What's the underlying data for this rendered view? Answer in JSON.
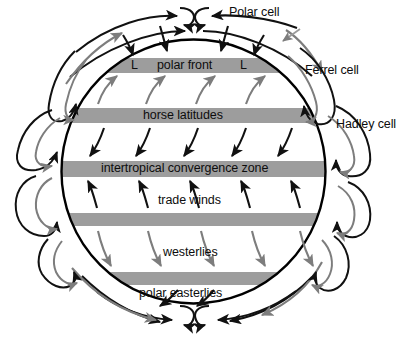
{
  "figure": {
    "background_color": "#ffffff",
    "band_color": "#9d9d9d",
    "surface_arrow_color": "#111111",
    "aloft_arrow_color": "#7d7d7d",
    "globe_outline_color": "#000000"
  },
  "cells": [
    {
      "id": "polar-cell",
      "label": "Polar cell"
    },
    {
      "id": "ferrel-cell",
      "label": "Ferrel cell"
    },
    {
      "id": "hadley-cell",
      "label": "Hadley cell"
    }
  ],
  "bands": [
    {
      "id": "polar-front",
      "label": "polar front",
      "y_center": 65.5,
      "labeled": true
    },
    {
      "id": "horse-latitudes",
      "label": "horse latitudes",
      "y_center": 115.5,
      "labeled": true
    },
    {
      "id": "itcz",
      "label": "intertropical convergence zone",
      "y_center": 169.0,
      "labeled": true
    },
    {
      "id": "band-south-horse",
      "label": "",
      "y_center": 219.5,
      "labeled": false
    },
    {
      "id": "band-south-polar-front",
      "label": "",
      "y_center": 278.5,
      "labeled": false
    }
  ],
  "wind_belts": [
    {
      "id": "trade-winds",
      "label": "trade winds",
      "hemisphere": "north"
    },
    {
      "id": "westerlies",
      "label": "westerlies",
      "hemisphere": "south"
    },
    {
      "id": "polar-easterlies",
      "label": "polar easterlies",
      "hemisphere": "south"
    }
  ],
  "pressure_marks": [
    {
      "id": "low-west",
      "label": "L"
    },
    {
      "id": "low-east",
      "label": "L"
    }
  ],
  "labels": {
    "polar_cell": "Polar cell",
    "ferrel_cell": "Ferrel cell",
    "hadley_cell": "Hadley cell",
    "polar_front": "polar front",
    "horse_latitudes": "horse latitudes",
    "itcz": "intertropical convergence zone",
    "trade_winds": "trade winds",
    "westerlies": "westerlies",
    "polar_easterlies": "polar easterlies",
    "low_west": "L",
    "low_east": "L"
  }
}
